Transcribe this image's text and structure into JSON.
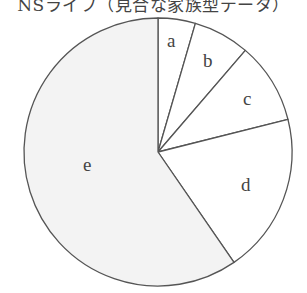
{
  "chart_data": {
    "type": "pie",
    "title": "NSライフ（見合な家族型データ）",
    "categories": [
      "a",
      "b",
      "c",
      "d",
      "e"
    ],
    "values": [
      4.5,
      6.8,
      9.8,
      19.3,
      59.6
    ],
    "unit": "%",
    "start_angle_deg": 0,
    "direction": "clockwise",
    "legend": "none",
    "labels_inside": true,
    "colors": {
      "a": "#ffffff",
      "b": "#ffffff",
      "c": "#ffffff",
      "d": "#ffffff",
      "e": "#f3f3f3",
      "stroke": "#555555"
    }
  },
  "labels": {
    "a": "a",
    "b": "b",
    "c": "c",
    "d": "d",
    "e": "e"
  }
}
